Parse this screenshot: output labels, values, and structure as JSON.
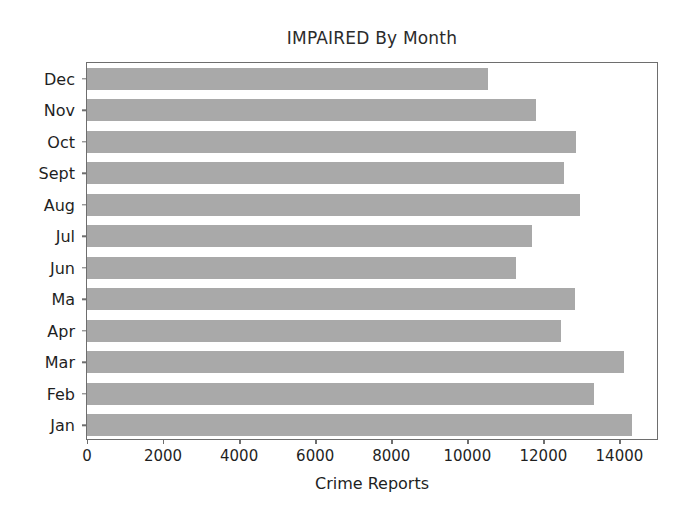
{
  "chart_data": {
    "type": "bar",
    "orientation": "horizontal",
    "title": "IMPAIRED By Month",
    "xlabel": "Crime Reports",
    "ylabel": "",
    "categories": [
      "Jan",
      "Feb",
      "Mar",
      "Apr",
      "Ma",
      "Jun",
      "Jul",
      "Aug",
      "Sept",
      "Oct",
      "Nov",
      "Dec"
    ],
    "values": [
      14320,
      13320,
      14130,
      12470,
      12820,
      11290,
      11710,
      12950,
      12550,
      12870,
      11815,
      10550
    ],
    "category_order_top_to_bottom": [
      "Dec",
      "Nov",
      "Oct",
      "Sept",
      "Aug",
      "Jul",
      "Jun",
      "Ma",
      "Apr",
      "Mar",
      "Feb",
      "Jan"
    ],
    "xlim": [
      0,
      15040
    ],
    "xticks": [
      0,
      2000,
      4000,
      6000,
      8000,
      10000,
      12000,
      14000
    ],
    "xtick_labels": [
      "0",
      "2000",
      "4000",
      "6000",
      "8000",
      "10000",
      "12000",
      "14000"
    ],
    "grid": false,
    "legend": null,
    "bar_color": "#a9a9a9",
    "axis_color": "#6e6e6e",
    "text_color": "#1f1f1f",
    "background": "#ffffff",
    "bars": [
      {
        "label": "Dec",
        "value": 10550
      },
      {
        "label": "Nov",
        "value": 11815
      },
      {
        "label": "Oct",
        "value": 12870
      },
      {
        "label": "Sept",
        "value": 12550
      },
      {
        "label": "Aug",
        "value": 12950
      },
      {
        "label": "Jul",
        "value": 11710
      },
      {
        "label": "Jun",
        "value": 11290
      },
      {
        "label": "Ma",
        "value": 12820
      },
      {
        "label": "Apr",
        "value": 12470
      },
      {
        "label": "Mar",
        "value": 14130
      },
      {
        "label": "Feb",
        "value": 13320
      },
      {
        "label": "Jan",
        "value": 14320
      }
    ]
  }
}
